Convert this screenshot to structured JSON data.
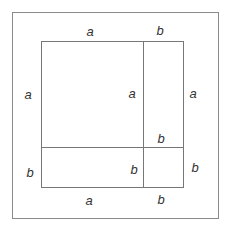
{
  "diagram": {
    "colors": {
      "line": "#888888",
      "text": "#333333",
      "background": "#ffffff"
    },
    "labels": {
      "top_a": "a",
      "top_b": "b",
      "left_a": "a",
      "left_b": "b",
      "inner_a": "a",
      "inner_b_right": "b",
      "inner_b_top": "b",
      "right_a": "a",
      "right_b": "b",
      "bottom_a": "a",
      "bottom_b": "b"
    }
  }
}
